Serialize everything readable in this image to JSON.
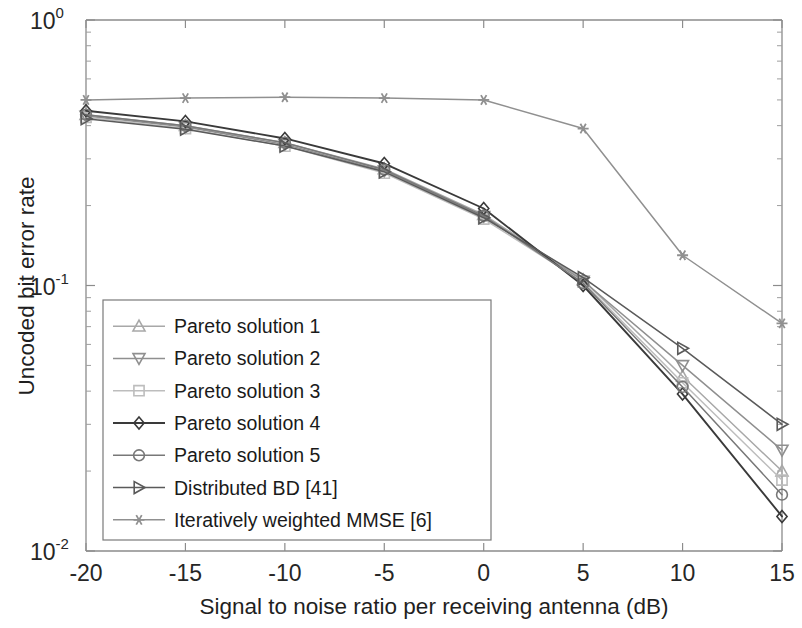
{
  "chart_data": {
    "type": "line",
    "title": "",
    "xlabel": "Signal to noise ratio per receiving antenna (dB)",
    "ylabel": "Uncoded bit error rate",
    "x": [
      -20,
      -15,
      -10,
      -5,
      0,
      5,
      10,
      15
    ],
    "xlim": [
      -20,
      15
    ],
    "xticks": [
      -20,
      -15,
      -10,
      -5,
      0,
      5,
      10,
      15
    ],
    "xtick_labels": [
      "-20",
      "-15",
      "-10",
      "-5",
      "0",
      "5",
      "10",
      "15"
    ],
    "ylim": [
      0.01,
      1.0
    ],
    "yscale": "log",
    "yticks": [
      0.01,
      0.1,
      1.0
    ],
    "ytick_labels": [
      "10",
      "10",
      "10"
    ],
    "ytick_exponents": [
      "-2",
      "-1",
      "0"
    ],
    "grid": false,
    "legend_position": "lower-left",
    "series": [
      {
        "name": "Pareto solution 1",
        "marker": "triangle-up",
        "color": "#a8a8a8",
        "values": [
          0.44,
          0.4,
          0.345,
          0.275,
          0.185,
          0.105,
          0.0455,
          0.02
        ]
      },
      {
        "name": "Pareto solution 2",
        "marker": "triangle-down",
        "color": "#8f8f8f",
        "values": [
          0.435,
          0.395,
          0.34,
          0.27,
          0.182,
          0.104,
          0.05,
          0.024
        ]
      },
      {
        "name": "Pareto solution 3",
        "marker": "square",
        "color": "#bdbdbd",
        "values": [
          0.43,
          0.39,
          0.335,
          0.265,
          0.178,
          0.103,
          0.043,
          0.0185
        ]
      },
      {
        "name": "Pareto solution 4",
        "marker": "diamond",
        "color": "#3a3a3a",
        "values": [
          0.455,
          0.415,
          0.358,
          0.288,
          0.195,
          0.1,
          0.039,
          0.0135
        ]
      },
      {
        "name": "Pareto solution 5",
        "marker": "circle",
        "color": "#787878",
        "values": [
          0.44,
          0.4,
          0.345,
          0.273,
          0.183,
          0.102,
          0.0415,
          0.0163
        ]
      },
      {
        "name": "Distributed BD [41]",
        "marker": "triangle-right",
        "color": "#5a5a5a",
        "values": [
          0.425,
          0.388,
          0.335,
          0.268,
          0.18,
          0.107,
          0.058,
          0.03
        ]
      },
      {
        "name": "Iteratively weighted MMSE [6]",
        "marker": "star",
        "color": "#909090",
        "values": [
          0.5,
          0.508,
          0.512,
          0.508,
          0.5,
          0.39,
          0.13,
          0.072
        ]
      }
    ]
  },
  "legend": {
    "items": [
      "Pareto solution 1",
      "Pareto solution 2",
      "Pareto solution 3",
      "Pareto solution 4",
      "Pareto solution 5",
      "Distributed BD [41]",
      "Iteratively weighted MMSE [6]"
    ]
  }
}
